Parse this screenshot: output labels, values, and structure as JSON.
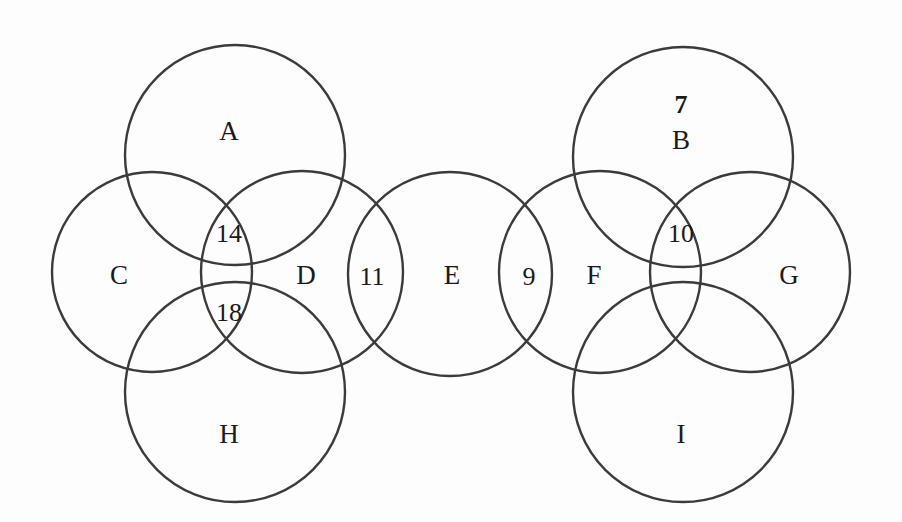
{
  "figure": {
    "type": "venn-diagram",
    "background_color": "#fdfdfd",
    "stroke_color": "#3b3b3b",
    "text_color": "#1a1a1a"
  },
  "circles": [
    {
      "id": "A",
      "cx": 235,
      "cy": 155,
      "r": 110
    },
    {
      "id": "B",
      "cx": 683,
      "cy": 157,
      "r": 110
    },
    {
      "id": "C",
      "cx": 152,
      "cy": 272,
      "r": 100
    },
    {
      "id": "D",
      "cx": 302,
      "cy": 272,
      "r": 101
    },
    {
      "id": "E",
      "cx": 450,
      "cy": 274,
      "r": 102
    },
    {
      "id": "F",
      "cx": 600,
      "cy": 272,
      "r": 101
    },
    {
      "id": "G",
      "cx": 750,
      "cy": 272,
      "r": 100
    },
    {
      "id": "H",
      "cx": 235,
      "cy": 392,
      "r": 110
    },
    {
      "id": "I",
      "cx": 683,
      "cy": 392,
      "r": 110
    }
  ],
  "labels": [
    {
      "key": "A",
      "text": "A",
      "x": 229,
      "y": 131,
      "bold": false,
      "kind": "set"
    },
    {
      "key": "B7",
      "text": "7",
      "x": 681,
      "y": 105,
      "bold": true,
      "kind": "count"
    },
    {
      "key": "B",
      "text": "B",
      "x": 681,
      "y": 140,
      "bold": false,
      "kind": "set"
    },
    {
      "key": "C",
      "text": "C",
      "x": 119,
      "y": 275,
      "bold": false,
      "kind": "set"
    },
    {
      "key": "N14",
      "text": "14",
      "x": 229,
      "y": 234,
      "bold": false,
      "kind": "count"
    },
    {
      "key": "N18",
      "text": "18",
      "x": 229,
      "y": 313,
      "bold": false,
      "kind": "count"
    },
    {
      "key": "D",
      "text": "D",
      "x": 306,
      "y": 275,
      "bold": false,
      "kind": "set"
    },
    {
      "key": "N11",
      "text": "11",
      "x": 372,
      "y": 277,
      "bold": false,
      "kind": "count"
    },
    {
      "key": "E",
      "text": "E",
      "x": 452,
      "y": 275,
      "bold": false,
      "kind": "set"
    },
    {
      "key": "N9",
      "text": "9",
      "x": 529,
      "y": 277,
      "bold": false,
      "kind": "count"
    },
    {
      "key": "F",
      "text": "F",
      "x": 594,
      "y": 275,
      "bold": false,
      "kind": "set"
    },
    {
      "key": "N10",
      "text": "10",
      "x": 681,
      "y": 234,
      "bold": false,
      "kind": "count"
    },
    {
      "key": "G",
      "text": "G",
      "x": 789,
      "y": 275,
      "bold": false,
      "kind": "set"
    },
    {
      "key": "H",
      "text": "H",
      "x": 229,
      "y": 434,
      "bold": false,
      "kind": "set"
    },
    {
      "key": "I",
      "text": "I",
      "x": 681,
      "y": 434,
      "bold": false,
      "kind": "set"
    }
  ]
}
